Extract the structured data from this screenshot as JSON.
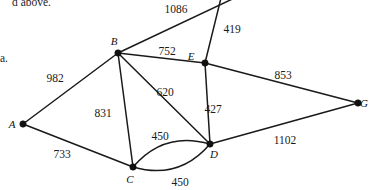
{
  "figure": {
    "type": "weighted-undirected-graph",
    "caption_top_fragment": "d above.",
    "caption_margin_fragment": "a."
  },
  "vertices": [
    {
      "id": "A",
      "label": "A",
      "x": 23,
      "y": 124,
      "label_dx": -11,
      "label_dy": 4
    },
    {
      "id": "B",
      "label": "B",
      "x": 118,
      "y": 53,
      "label_dx": -4,
      "label_dy": -8
    },
    {
      "id": "C",
      "label": "C",
      "x": 133,
      "y": 167,
      "label_dx": -3,
      "label_dy": 16
    },
    {
      "id": "D",
      "label": "D",
      "x": 210,
      "y": 144,
      "label_dx": 4,
      "label_dy": 14
    },
    {
      "id": "E",
      "label": "E",
      "x": 205,
      "y": 63,
      "label_dx": -14,
      "label_dy": -3
    },
    {
      "id": "G",
      "label": "G",
      "x": 358,
      "y": 103,
      "label_dx": 6,
      "label_dy": 4
    }
  ],
  "edges": [
    {
      "id": "A-B",
      "from": "A",
      "to": "B",
      "weight": "982",
      "label_x": 55,
      "label_y": 82,
      "curved": false
    },
    {
      "id": "A-C",
      "from": "A",
      "to": "C",
      "weight": "733",
      "label_x": 62,
      "label_y": 158,
      "curved": false
    },
    {
      "id": "B-C",
      "from": "B",
      "to": "C",
      "weight": "831",
      "label_x": 103,
      "label_y": 117,
      "curved": false
    },
    {
      "id": "B-D",
      "from": "B",
      "to": "D",
      "weight": "620",
      "label_x": 165,
      "label_y": 96,
      "curved": false
    },
    {
      "id": "B-E",
      "from": "B",
      "to": "E",
      "weight": "752",
      "label_x": 167,
      "label_y": 55,
      "curved": false
    },
    {
      "id": "B-top",
      "from": "B",
      "to": "TOP1",
      "weight": "1086",
      "label_x": 176,
      "label_y": 13,
      "curved": false
    },
    {
      "id": "E-top",
      "from": "E",
      "to": "TOP2",
      "weight": "419",
      "label_x": 232,
      "label_y": 33,
      "curved": false
    },
    {
      "id": "E-D",
      "from": "E",
      "to": "D",
      "weight": "427",
      "label_x": 213,
      "label_y": 113,
      "curved": false
    },
    {
      "id": "E-G",
      "from": "E",
      "to": "G",
      "weight": "853",
      "label_x": 283,
      "label_y": 79,
      "curved": false
    },
    {
      "id": "D-G",
      "from": "D",
      "to": "G",
      "weight": "1102",
      "label_x": 285,
      "label_y": 144,
      "curved": false
    },
    {
      "id": "C-D-a",
      "from": "C",
      "to": "D",
      "weight": "450",
      "label_x": 160,
      "label_y": 140,
      "curved": true
    },
    {
      "id": "C-D-b",
      "from": "C",
      "to": "D",
      "weight": "450",
      "label_x": 180,
      "label_y": 186,
      "curved": true
    }
  ],
  "offscreen_anchors": [
    {
      "id": "TOP1",
      "x": 243,
      "y": -6
    },
    {
      "id": "TOP2",
      "x": 222,
      "y": -6
    }
  ],
  "colors": {
    "stroke": "#1a1a1a",
    "vertex": "#111111",
    "background": "#ffffff",
    "text": "#1a1a1a"
  }
}
